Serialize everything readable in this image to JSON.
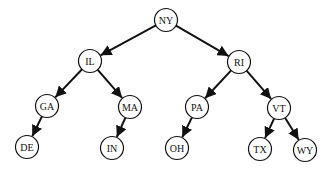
{
  "diagram": {
    "type": "binary-tree",
    "colors": {
      "edge": "#111111",
      "node_stroke": "#111111",
      "node_fill": "#ffffff",
      "background": "#ffffff"
    },
    "node_radius": 11.5,
    "nodes": [
      {
        "id": "NY",
        "label": "NY",
        "x": 166,
        "y": 20
      },
      {
        "id": "IL",
        "label": "IL",
        "x": 90,
        "y": 61
      },
      {
        "id": "RI",
        "label": "RI",
        "x": 239,
        "y": 62
      },
      {
        "id": "GA",
        "label": "GA",
        "x": 47,
        "y": 106
      },
      {
        "id": "MA",
        "label": "MA",
        "x": 130,
        "y": 107
      },
      {
        "id": "PA",
        "label": "PA",
        "x": 197,
        "y": 107
      },
      {
        "id": "VT",
        "label": "VT",
        "x": 279,
        "y": 108
      },
      {
        "id": "DE",
        "label": "DE",
        "x": 27,
        "y": 147
      },
      {
        "id": "IN",
        "label": "IN",
        "x": 112,
        "y": 148
      },
      {
        "id": "OH",
        "label": "OH",
        "x": 177,
        "y": 148
      },
      {
        "id": "TX",
        "label": "TX",
        "x": 260,
        "y": 149
      },
      {
        "id": "WY",
        "label": "WY",
        "x": 305,
        "y": 150
      }
    ],
    "edges": [
      {
        "from": "NY",
        "to": "IL"
      },
      {
        "from": "NY",
        "to": "RI"
      },
      {
        "from": "IL",
        "to": "GA"
      },
      {
        "from": "IL",
        "to": "MA"
      },
      {
        "from": "RI",
        "to": "PA"
      },
      {
        "from": "RI",
        "to": "VT"
      },
      {
        "from": "GA",
        "to": "DE"
      },
      {
        "from": "MA",
        "to": "IN"
      },
      {
        "from": "PA",
        "to": "OH"
      },
      {
        "from": "VT",
        "to": "TX"
      },
      {
        "from": "VT",
        "to": "WY"
      }
    ]
  }
}
